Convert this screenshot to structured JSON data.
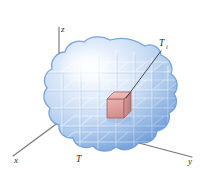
{
  "figure": {
    "width": 201,
    "height": 169,
    "background_color": "#ffffff"
  },
  "axes": {
    "origin": {
      "x": 59,
      "y": 122
    },
    "items": [
      {
        "name": "z-axis",
        "label": "z",
        "label_x": 60,
        "label_y": 31,
        "line": {
          "x1": 59,
          "y1": 122,
          "x2": 59,
          "y2": 27
        },
        "color": "#6b6b6b"
      },
      {
        "name": "x-axis",
        "label": "x",
        "label_x": 17,
        "label_y": 161,
        "line": {
          "x1": 59,
          "y1": 122,
          "x2": 13,
          "y2": 156
        },
        "color": "#6b6b6b"
      },
      {
        "name": "y-axis",
        "label": "y",
        "label_x": 190,
        "label_y": 162,
        "line": {
          "x1": 59,
          "y1": 122,
          "x2": 192,
          "y2": 157
        },
        "color": "#6b6b6b"
      }
    ]
  },
  "body": {
    "label": "T",
    "label_x": 79,
    "label_y": 160,
    "fill_color": "#b9d0ee",
    "rim_color": "#5f8fd0",
    "highlight_color": "#f2f7fd",
    "grid_color": "#ffffff",
    "grid_shadow_color": "#8fb2de"
  },
  "element_cube": {
    "label": "T",
    "subscript": "i",
    "label_x": 163,
    "label_y": 47,
    "subscript_x": 170,
    "subscript_y": 50,
    "fill_color": "#e0a0a0",
    "top_color": "#eebcbc",
    "side_color": "#c98b8b",
    "edge_color": "#a85f5f",
    "center_x": 118,
    "center_y": 105,
    "leader_line": {
      "x1": 161,
      "y1": 50,
      "x2": 126,
      "y2": 99
    },
    "leader_color": "#3a3a3a"
  }
}
